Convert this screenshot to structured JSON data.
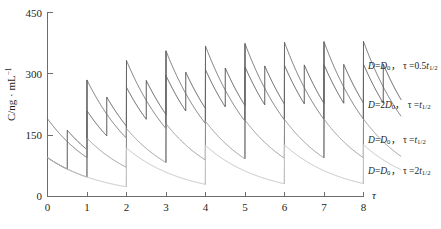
{
  "chart_data": {
    "type": "line",
    "title": "",
    "xlabel": "τ",
    "ylabel": "C/ng · mL⁻¹",
    "xlim": [
      0,
      8
    ],
    "ylim": [
      0,
      450
    ],
    "xticks": [
      0,
      1,
      2,
      3,
      4,
      5,
      6,
      7,
      8
    ],
    "yticks": [
      0,
      150,
      300,
      450
    ],
    "grid": false,
    "legend_position": "right-inline",
    "series": [
      {
        "name": "D=D0, tau=0.5t1/2",
        "label_html": "<i>D</i>=<i>D</i><sub>0</sub>， τ =0.5<i>t</i><sub>1/2</sub>",
        "color": "#4a4a4a",
        "dose_interval": 0.5,
        "dose_increment": 95,
        "initial": 95,
        "steady_peak": 370,
        "steady_trough": 255,
        "label_x": 368,
        "label_y": 67
      },
      {
        "name": "D=2D0, tau=t1/2",
        "label_html": "<i>D</i>=2<i>D</i><sub>0</sub>， τ =<i>t</i><sub>1/2</sub>",
        "color": "#666666",
        "dose_interval": 1.0,
        "dose_increment": 190,
        "initial": 190,
        "steady_peak": 375,
        "steady_trough": 188,
        "label_x": 368,
        "label_y": 106
      },
      {
        "name": "D=D0, tau=t1/2",
        "label_html": "<i>D</i>=<i>D</i><sub>0</sub>， τ =<i>t</i><sub>1/2</sub>",
        "color": "#8c8c8c",
        "dose_interval": 1.0,
        "dose_increment": 95,
        "initial": 95,
        "steady_peak": 190,
        "steady_trough": 95,
        "label_x": 368,
        "label_y": 141
      },
      {
        "name": "D=D0, tau=2t1/2",
        "label_html": "<i>D</i>=<i>D</i><sub>0</sub>， τ =2<i>t</i><sub>1/2</sub>",
        "color": "#c2c2c2",
        "dose_interval": 2.0,
        "dose_increment": 95,
        "initial": 95,
        "steady_peak": 126,
        "steady_trough": 31,
        "label_x": 368,
        "label_y": 172
      }
    ]
  },
  "axis": {
    "y_title_prefix": "C/ng · mL",
    "y_title_exp": "−1",
    "x_title": "τ",
    "x_tick_labels": [
      "0",
      "1",
      "2",
      "3",
      "4",
      "5",
      "6",
      "7",
      "8"
    ],
    "y_tick_labels": [
      "0",
      "150",
      "300",
      "450"
    ]
  }
}
